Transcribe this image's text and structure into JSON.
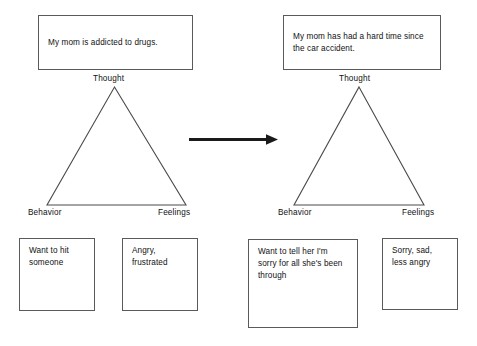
{
  "diagram": {
    "transition_arrow": "arrow-right",
    "panels": [
      {
        "id": "before",
        "thought_box": "My mom is addicted to drugs.",
        "thought_label": "Thought",
        "behavior_label": "Behavior",
        "feelings_label": "Feelings",
        "behavior_box": "Want to hit someone",
        "feelings_box": "Angry, frustrated"
      },
      {
        "id": "after",
        "thought_box": "My mom has had a hard time since the car accident.",
        "thought_label": "Thought",
        "behavior_label": "Behavior",
        "feelings_label": "Feelings",
        "behavior_box": "Want to tell her I'm sorry for all she's been through",
        "feelings_box": "Sorry, sad, less angry"
      }
    ],
    "colors": {
      "background": "#ffffff",
      "box_border": "#5a5a5a",
      "triangle_stroke": "#4a4a4a",
      "arrow": "#1a1a1a",
      "text": "#111111"
    }
  }
}
